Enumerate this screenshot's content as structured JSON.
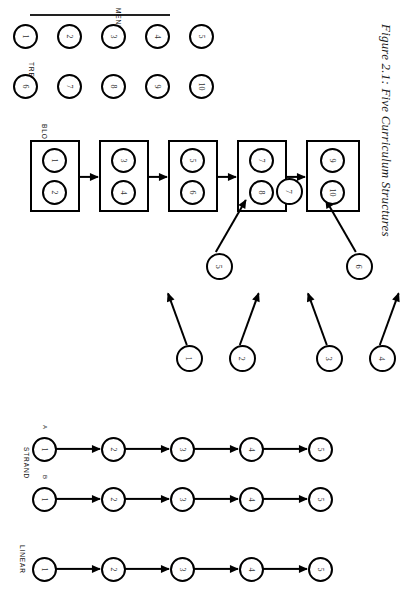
{
  "figure": {
    "title": "Figure 2.1: Five Curriculum Structures",
    "orientation": "rotated-90",
    "page_background": "#ffffff",
    "ink_color": "#000000"
  },
  "structures": [
    {
      "key": "menu",
      "label": "MENU",
      "description": "Two rows of unconnected nodes, no arrows",
      "rows": [
        {
          "name": "top-row",
          "nodes": [
            "6",
            "7",
            "8",
            "9",
            "10"
          ]
        },
        {
          "name": "bottom-row",
          "nodes": [
            "1",
            "2",
            "3",
            "4",
            "5"
          ]
        }
      ],
      "arrows": []
    },
    {
      "key": "tree",
      "label": "TREE",
      "description": "Root node 7 with children 6 and 5; node 6 has leaves 4 and 3; node 5 has leaves 2 and 1",
      "root": "7",
      "branches": [
        {
          "parent": "6",
          "leaves": [
            "4",
            "3"
          ]
        },
        {
          "parent": "5",
          "leaves": [
            "2",
            "1"
          ]
        }
      ],
      "edges": [
        {
          "from": "6",
          "to": "7"
        },
        {
          "from": "5",
          "to": "7"
        },
        {
          "from": "4",
          "to": "6"
        },
        {
          "from": "3",
          "to": "6"
        },
        {
          "from": "2",
          "to": "5"
        },
        {
          "from": "1",
          "to": "5"
        }
      ]
    },
    {
      "key": "block",
      "label": "BLOCK",
      "description": "Five boxed blocks of two nodes each, linked left to right by arrows",
      "blocks": [
        {
          "index": 1,
          "nodes": [
            "1",
            "2"
          ]
        },
        {
          "index": 2,
          "nodes": [
            "3",
            "4"
          ]
        },
        {
          "index": 3,
          "nodes": [
            "5",
            "6"
          ]
        },
        {
          "index": 4,
          "nodes": [
            "7",
            "8"
          ]
        },
        {
          "index": 5,
          "nodes": [
            "9",
            "10"
          ]
        }
      ],
      "arrow_count": 4
    },
    {
      "key": "strand",
      "label": "STRAND",
      "description": "Two parallel sequential strands labelled A and B",
      "strands": [
        {
          "name": "A",
          "nodes": [
            "1",
            "2",
            "3",
            "4",
            "5"
          ]
        },
        {
          "name": "B",
          "nodes": [
            "1",
            "2",
            "3",
            "4",
            "5"
          ]
        }
      ]
    },
    {
      "key": "linear",
      "label": "LINEAR",
      "description": "One sequential chain of five nodes",
      "nodes": [
        "1",
        "2",
        "3",
        "4",
        "5"
      ]
    }
  ]
}
